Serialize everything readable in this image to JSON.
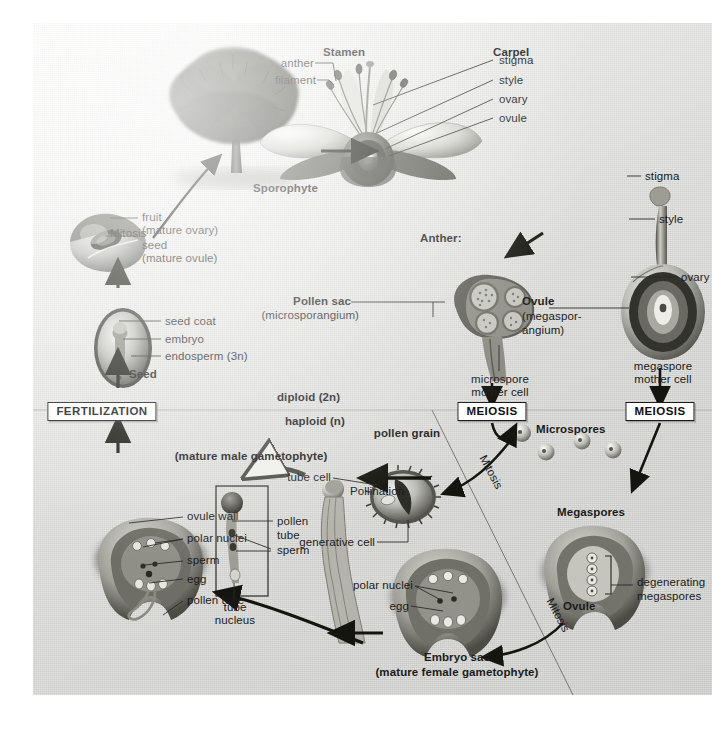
{
  "figure": {
    "background_color": "#d4d4d2",
    "ink_color": "#1b1b1b"
  },
  "ploidy": {
    "diploid": "diploid (2n)",
    "haploid": "haploid (n)"
  },
  "process_boxes": {
    "fertilization": "FERTILIZATION",
    "meiosis_left": "MEIOSIS",
    "meiosis_right": "MEIOSIS"
  },
  "mitosis_labels": {
    "tree": "Mitosis",
    "microspore": "Mitosis",
    "megaspore": "Mitosis"
  },
  "sporophyte": {
    "label": "Sporophyte",
    "fruit": "fruit",
    "fruit_sub": "(mature ovary)",
    "seed": "seed",
    "seed_sub": "(mature ovule)"
  },
  "flower": {
    "stamen": "Stamen",
    "anther": "anther",
    "filament": "filament",
    "carpel": "Carpel",
    "stigma": "stigma",
    "style": "style",
    "ovary": "ovary",
    "ovule": "ovule"
  },
  "seed_detail": {
    "title": "Seed",
    "seed_coat": "seed coat",
    "embryo": "embryo",
    "endosperm": "endosperm (3n)"
  },
  "anther_detail": {
    "title": "Anther:",
    "pollen_sac": "Pollen sac",
    "pollen_sac_sub": "(microsporangium)",
    "microspore_mother_cell_1": "microspore",
    "microspore_mother_cell_2": "mother cell"
  },
  "pistil_detail": {
    "ovule": "Ovule",
    "ovule_sub_1": "(megaspor-",
    "ovule_sub_2": "angium)",
    "stigma": "stigma",
    "style": "style",
    "ovary": "ovary",
    "megaspore_mother_cell_1": "megaspore",
    "megaspore_mother_cell_2": "mother cell"
  },
  "spores": {
    "microspores": "Microspores",
    "megaspores": "Megaspores"
  },
  "pollen": {
    "pollen_grain": "pollen grain",
    "tube_cell": "tube cell",
    "generative_cell": "generative cell",
    "pollination": "Pollination",
    "mature_male_gametophyte": "(mature male gametophyte)",
    "pollen_tube_1": "pollen",
    "pollen_tube_2": "tube",
    "sperm": "sperm",
    "tube_nucleus_1": "tube",
    "tube_nucleus_2": "nucleus"
  },
  "embryo_sac": {
    "title": "Embryo sac",
    "subtitle": "(mature female gametophyte)",
    "polar_nuclei": "polar nuclei",
    "egg": "egg"
  },
  "fertilized_ovule": {
    "ovule_wall": "ovule wall",
    "polar_nuclei": "polar nuclei",
    "sperm": "sperm",
    "egg": "egg",
    "pollen_tube": "pollen tube"
  },
  "megaspore_ovule": {
    "ovule": "Ovule",
    "degenerating_1": "degenerating",
    "degenerating_2": "megaspores"
  }
}
